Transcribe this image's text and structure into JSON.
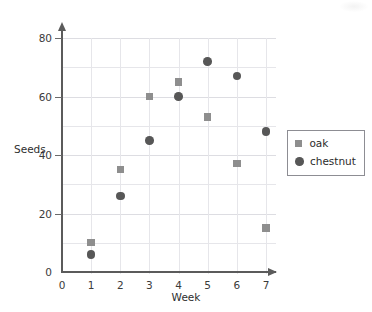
{
  "chart_data": {
    "type": "scatter",
    "title": "",
    "xlabel": "Week",
    "ylabel": "Seeds",
    "xlim": [
      0,
      7
    ],
    "ylim": [
      0,
      80
    ],
    "x_ticks": [
      0,
      1,
      2,
      3,
      4,
      5,
      6,
      7
    ],
    "y_ticks": [
      0,
      20,
      40,
      60,
      80
    ],
    "y_gridlines": [
      10,
      20,
      30,
      40,
      50,
      60,
      70,
      80
    ],
    "grid": true,
    "legend_position": "right",
    "x": [
      1,
      2,
      3,
      4,
      5,
      6,
      7
    ],
    "series": [
      {
        "name": "oak",
        "marker": "square",
        "color": "#8e8e8e",
        "values": [
          10,
          35,
          60,
          65,
          53,
          37,
          15
        ]
      },
      {
        "name": "chestnut",
        "marker": "circle",
        "color": "#575757",
        "values": [
          6,
          26,
          45,
          60,
          72,
          67,
          48
        ]
      }
    ]
  },
  "axes": {
    "x_tick_labels": [
      "0",
      "1",
      "2",
      "3",
      "4",
      "5",
      "6",
      "7"
    ],
    "y_tick_labels": [
      "0",
      "20",
      "40",
      "60",
      "80"
    ],
    "x_title": "Week",
    "y_title": "Seeds"
  },
  "legend": {
    "items": [
      {
        "label": "oak",
        "marker": "square-marker-icon"
      },
      {
        "label": "chestnut",
        "marker": "circle-marker-icon"
      }
    ]
  },
  "colors": {
    "oak": "#8e8e8e",
    "chestnut": "#575757",
    "axis": "#5b5b5b",
    "grid": "#e6e6ea",
    "background": "#ffffff"
  }
}
